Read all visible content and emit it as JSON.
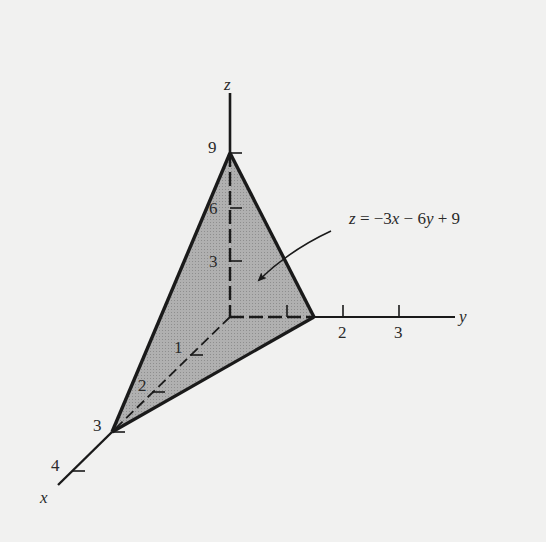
{
  "figure": {
    "type": "3d-plane-diagram",
    "background_color": "#f1f1f0",
    "plane_fill_color": "#ababab",
    "line_color": "#1a1a1a",
    "equation_label": "z = −3x − 6y + 9",
    "axes": {
      "x": {
        "label": "x",
        "ticks": [
          "1",
          "2",
          "3",
          "4"
        ]
      },
      "y": {
        "label": "y",
        "ticks": [
          "2",
          "3"
        ]
      },
      "z": {
        "label": "z",
        "ticks": [
          "3",
          "6",
          "9"
        ]
      }
    },
    "intercepts": {
      "x": 3,
      "y": 1.5,
      "z": 9
    },
    "plane": {
      "equation": "z = -3x - 6y + 9",
      "vertices": [
        [
          3,
          0,
          0
        ],
        [
          0,
          1.5,
          0
        ],
        [
          0,
          0,
          9
        ]
      ]
    }
  }
}
